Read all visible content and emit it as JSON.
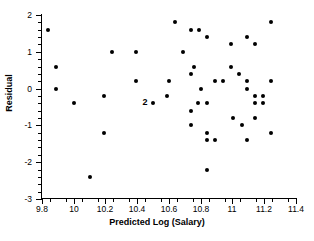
{
  "chart_data": {
    "type": "scatter",
    "title": "",
    "xlabel": "Predicted Log (Salary)",
    "ylabel": "Residual",
    "xlim": [
      9.8,
      11.4
    ],
    "ylim": [
      -3,
      2
    ],
    "xticks": [
      "9.8",
      "10",
      "10.2",
      "10.4",
      "10.6",
      "10.8",
      "11",
      "11.2",
      "11.4"
    ],
    "xtick_values": [
      9.8,
      10.0,
      10.2,
      10.4,
      10.6,
      10.8,
      11.0,
      11.2,
      11.4
    ],
    "yticks": [
      "2",
      "1",
      "0",
      "-1",
      "-2",
      "-3"
    ],
    "ytick_values": [
      2,
      1,
      0,
      -1,
      -2,
      -3
    ],
    "grid": false,
    "legend": "none",
    "marker": "filled-circle",
    "marker_color": "#000000",
    "points": [
      {
        "x": 9.84,
        "y": 1.6
      },
      {
        "x": 9.89,
        "y": 0.6
      },
      {
        "x": 9.89,
        "y": 0.0
      },
      {
        "x": 10.0,
        "y": -0.4
      },
      {
        "x": 10.19,
        "y": -0.2
      },
      {
        "x": 10.19,
        "y": -1.2
      },
      {
        "x": 10.1,
        "y": -2.4
      },
      {
        "x": 10.24,
        "y": 1.0
      },
      {
        "x": 10.39,
        "y": 1.0
      },
      {
        "x": 10.39,
        "y": 0.2
      },
      {
        "x": 10.5,
        "y": -0.4
      },
      {
        "x": 10.59,
        "y": -0.2
      },
      {
        "x": 10.6,
        "y": 0.2
      },
      {
        "x": 10.64,
        "y": 1.8
      },
      {
        "x": 10.69,
        "y": 1.0
      },
      {
        "x": 10.74,
        "y": 1.6
      },
      {
        "x": 10.79,
        "y": 1.6
      },
      {
        "x": 10.84,
        "y": 1.4
      },
      {
        "x": 10.74,
        "y": 0.4
      },
      {
        "x": 10.76,
        "y": 0.6
      },
      {
        "x": 10.8,
        "y": 0.0
      },
      {
        "x": 10.74,
        "y": -0.6
      },
      {
        "x": 10.74,
        "y": -1.0
      },
      {
        "x": 10.78,
        "y": -0.4
      },
      {
        "x": 10.84,
        "y": -0.4
      },
      {
        "x": 10.84,
        "y": -1.2
      },
      {
        "x": 10.84,
        "y": -1.4
      },
      {
        "x": 10.89,
        "y": -1.4
      },
      {
        "x": 10.89,
        "y": 0.2
      },
      {
        "x": 10.84,
        "y": -2.2
      },
      {
        "x": 10.94,
        "y": 0.2
      },
      {
        "x": 10.99,
        "y": 1.2
      },
      {
        "x": 10.99,
        "y": 0.6
      },
      {
        "x": 11.0,
        "y": -0.8
      },
      {
        "x": 11.04,
        "y": 0.4
      },
      {
        "x": 11.06,
        "y": -1.0
      },
      {
        "x": 11.09,
        "y": 1.4
      },
      {
        "x": 11.09,
        "y": 0.2
      },
      {
        "x": 11.09,
        "y": 0.0
      },
      {
        "x": 11.09,
        "y": -1.4
      },
      {
        "x": 11.14,
        "y": 1.2
      },
      {
        "x": 11.14,
        "y": -0.2
      },
      {
        "x": 11.14,
        "y": -0.4
      },
      {
        "x": 11.14,
        "y": -0.8
      },
      {
        "x": 11.19,
        "y": -0.2
      },
      {
        "x": 11.19,
        "y": -0.4
      },
      {
        "x": 11.24,
        "y": 1.8
      },
      {
        "x": 11.24,
        "y": 0.2
      },
      {
        "x": 11.24,
        "y": -1.2
      }
    ],
    "annotations": [
      {
        "text": "2",
        "x": 10.49,
        "y": -0.4,
        "note": "overlap-count-label"
      }
    ]
  }
}
